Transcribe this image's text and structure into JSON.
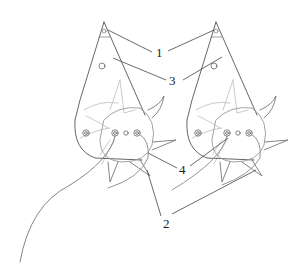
{
  "figure": {
    "type": "patent line drawing"
  },
  "labels": [
    {
      "id": "1",
      "text": "1",
      "x": 156,
      "y": 46
    },
    {
      "id": "3",
      "text": "3",
      "x": 170,
      "y": 74
    },
    {
      "id": "4",
      "text": "4",
      "x": 182,
      "y": 164
    },
    {
      "id": "2",
      "text": "2",
      "x": 163,
      "y": 216
    }
  ],
  "colors": {
    "line_dark": "#444444",
    "line_light": "#b8b8b8",
    "label": "#222222"
  }
}
